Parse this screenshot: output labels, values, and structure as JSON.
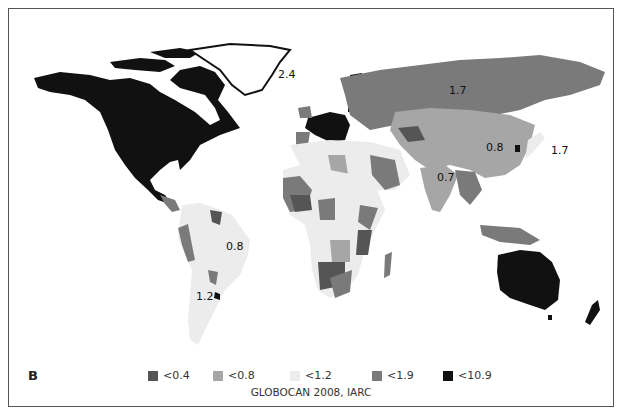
{
  "panel_label": "B",
  "source": "GLOBOCAN 2008, IARC",
  "legend": [
    {
      "label": "<0.4",
      "color": "#555555"
    },
    {
      "label": "<0.8",
      "color": "#a6a6a6"
    },
    {
      "label": "<1.2",
      "color": "#ececec"
    },
    {
      "label": "<1.9",
      "color": "#7a7a7a"
    },
    {
      "label": "<10.9",
      "color": "#111111"
    }
  ],
  "map_labels": [
    {
      "text": "2.4",
      "region": "Greenland"
    },
    {
      "text": "1.7",
      "region": "Russia"
    },
    {
      "text": "0.8",
      "region": "China"
    },
    {
      "text": "1.7",
      "region": "Japan"
    },
    {
      "text": "0.7",
      "region": "India"
    },
    {
      "text": "0.8",
      "region": "Brazil"
    },
    {
      "text": "1.2",
      "region": "Argentina"
    }
  ]
}
